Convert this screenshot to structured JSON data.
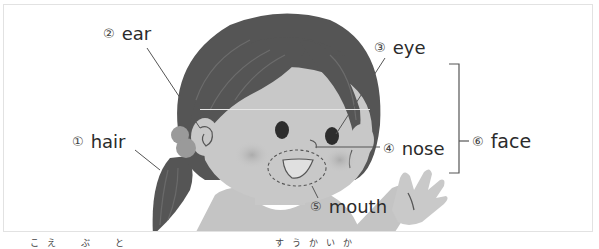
{
  "diagram": {
    "labels": [
      {
        "num": "①",
        "text": "hair"
      },
      {
        "num": "②",
        "text": "ear"
      },
      {
        "num": "③",
        "text": "eye"
      },
      {
        "num": "④",
        "text": "nose"
      },
      {
        "num": "⑤",
        "text": "mouth"
      },
      {
        "num": "⑥",
        "text": "face"
      }
    ],
    "colors": {
      "hair": "#555555",
      "skin": "#c8c8c8",
      "cheek": "#b5b5b5",
      "scrunchie": "#9a9a9a",
      "shirt": "#c4c4c4",
      "line": "#555555",
      "frame": "#e2e2e2",
      "text": "#2b2b2b"
    }
  },
  "footer": {
    "left_fragment": "こえ　ぶ　と",
    "right_fragment": "すうかいか"
  }
}
